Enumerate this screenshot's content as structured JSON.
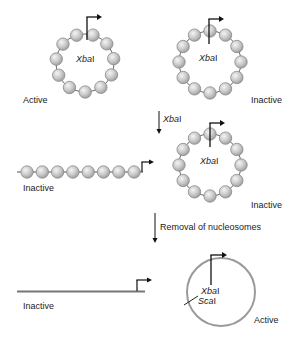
{
  "colors": {
    "bead_fill": "#c8c8c8",
    "bead_highlight": "#f2f2f2",
    "bead_stroke": "#8a8a8a",
    "dna": "#555555",
    "ring": "#999999",
    "arrow": "#111111",
    "text": "#222222"
  },
  "panels": {
    "top_left": {
      "site_label": "XbaI",
      "site_italic": "Xba",
      "site_roman": "I",
      "state": "Active"
    },
    "top_right": {
      "site_label": "XbaI",
      "site_italic": "Xba",
      "site_roman": "I",
      "state": "Inactive"
    },
    "step1": {
      "enzyme_italic": "Xba",
      "enzyme_roman": "I"
    },
    "mid_left": {
      "state": "Inactive"
    },
    "mid_right": {
      "site_italic": "Xba",
      "site_roman": "I",
      "state": "Inactive"
    },
    "step2": {
      "label": "Removal of nucleosomes"
    },
    "bottom_left": {
      "state": "Inactive"
    },
    "bottom_right": {
      "site1_italic": "Xba",
      "site1_roman": "I",
      "site2_italic": "Sca",
      "site2_roman": "I",
      "state": "Active"
    }
  }
}
